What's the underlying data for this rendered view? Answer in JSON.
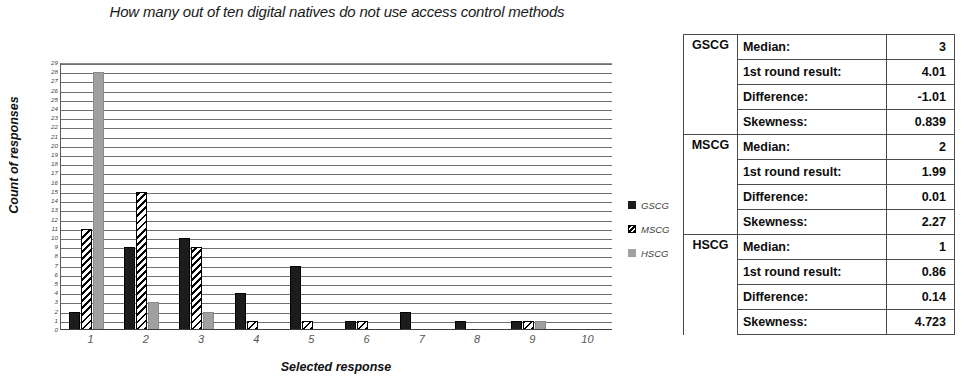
{
  "chart_data": {
    "type": "bar",
    "title": "How many out of ten digital natives do not use access control methods",
    "xlabel": "Selected response",
    "ylabel": "Count of responses",
    "categories": [
      "1",
      "2",
      "3",
      "4",
      "5",
      "6",
      "7",
      "8",
      "9",
      "10"
    ],
    "series": [
      {
        "name": "GSCG",
        "color": "#1c1c1c",
        "fill": "solid-black",
        "values": [
          2,
          9,
          10,
          4,
          7,
          1,
          2,
          1,
          1,
          0
        ]
      },
      {
        "name": "MSCG",
        "color": "#000000",
        "fill": "diagonal-hatch",
        "values": [
          11,
          15,
          9,
          1,
          1,
          1,
          0,
          0,
          1,
          0
        ]
      },
      {
        "name": "HSCG",
        "color": "#a0a0a0",
        "fill": "solid-gray",
        "values": [
          28,
          3,
          2,
          0,
          0,
          0,
          0,
          0,
          1,
          0
        ]
      }
    ],
    "ylim": [
      0,
      29
    ],
    "ytick_values": [
      0,
      1,
      2,
      3,
      4,
      5,
      6,
      7,
      8,
      9,
      10,
      11,
      12,
      13,
      14,
      15,
      16,
      17,
      18,
      19,
      20,
      21,
      22,
      23,
      24,
      25,
      26,
      27,
      28,
      29
    ],
    "grid": true,
    "legend_position": "right",
    "legend": [
      "GSCG",
      "MSCG",
      "HSCG"
    ]
  },
  "legend": {
    "items": [
      {
        "label": "GSCG"
      },
      {
        "label": "MSCG"
      },
      {
        "label": "HSCG"
      }
    ]
  },
  "stats_table": {
    "groups": [
      {
        "name": "GSCG",
        "rows": [
          {
            "label": "Median:",
            "value": "3"
          },
          {
            "label": "1st round result:",
            "value": "4.01"
          },
          {
            "label": "Difference:",
            "value": "-1.01"
          },
          {
            "label": "Skewness:",
            "value": "0.839"
          }
        ]
      },
      {
        "name": "MSCG",
        "rows": [
          {
            "label": "Median:",
            "value": "2"
          },
          {
            "label": "1st round result:",
            "value": "1.99"
          },
          {
            "label": "Difference:",
            "value": "0.01"
          },
          {
            "label": "Skewness:",
            "value": "2.27"
          }
        ]
      },
      {
        "name": "HSCG",
        "rows": [
          {
            "label": "Median:",
            "value": "1"
          },
          {
            "label": "1st round result:",
            "value": "0.86"
          },
          {
            "label": "Difference:",
            "value": "0.14"
          },
          {
            "label": "Skewness:",
            "value": "4.723"
          }
        ]
      }
    ]
  }
}
